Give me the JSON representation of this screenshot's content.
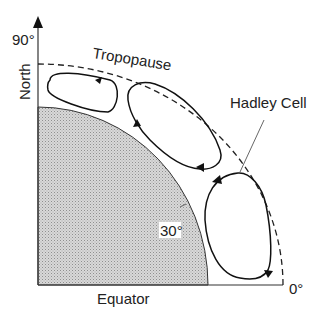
{
  "diagram": {
    "labels": {
      "north_axis": "North",
      "latitude_top": "90°",
      "latitude_mid": "30°",
      "latitude_bottom": "0°",
      "equator": "Equator",
      "tropopause": "Tropopause",
      "hadley_cell": "Hadley Cell"
    },
    "cells": [
      {
        "name": "polar-cell",
        "direction": "counter-clockwise"
      },
      {
        "name": "ferrel-cell",
        "direction": "clockwise"
      },
      {
        "name": "hadley-cell",
        "direction": "counter-clockwise"
      }
    ],
    "colors": {
      "line": "#222222",
      "earth_fill": "#cfcfcf",
      "earth_hatch": "#9a9a9a",
      "background": "#ffffff"
    }
  }
}
